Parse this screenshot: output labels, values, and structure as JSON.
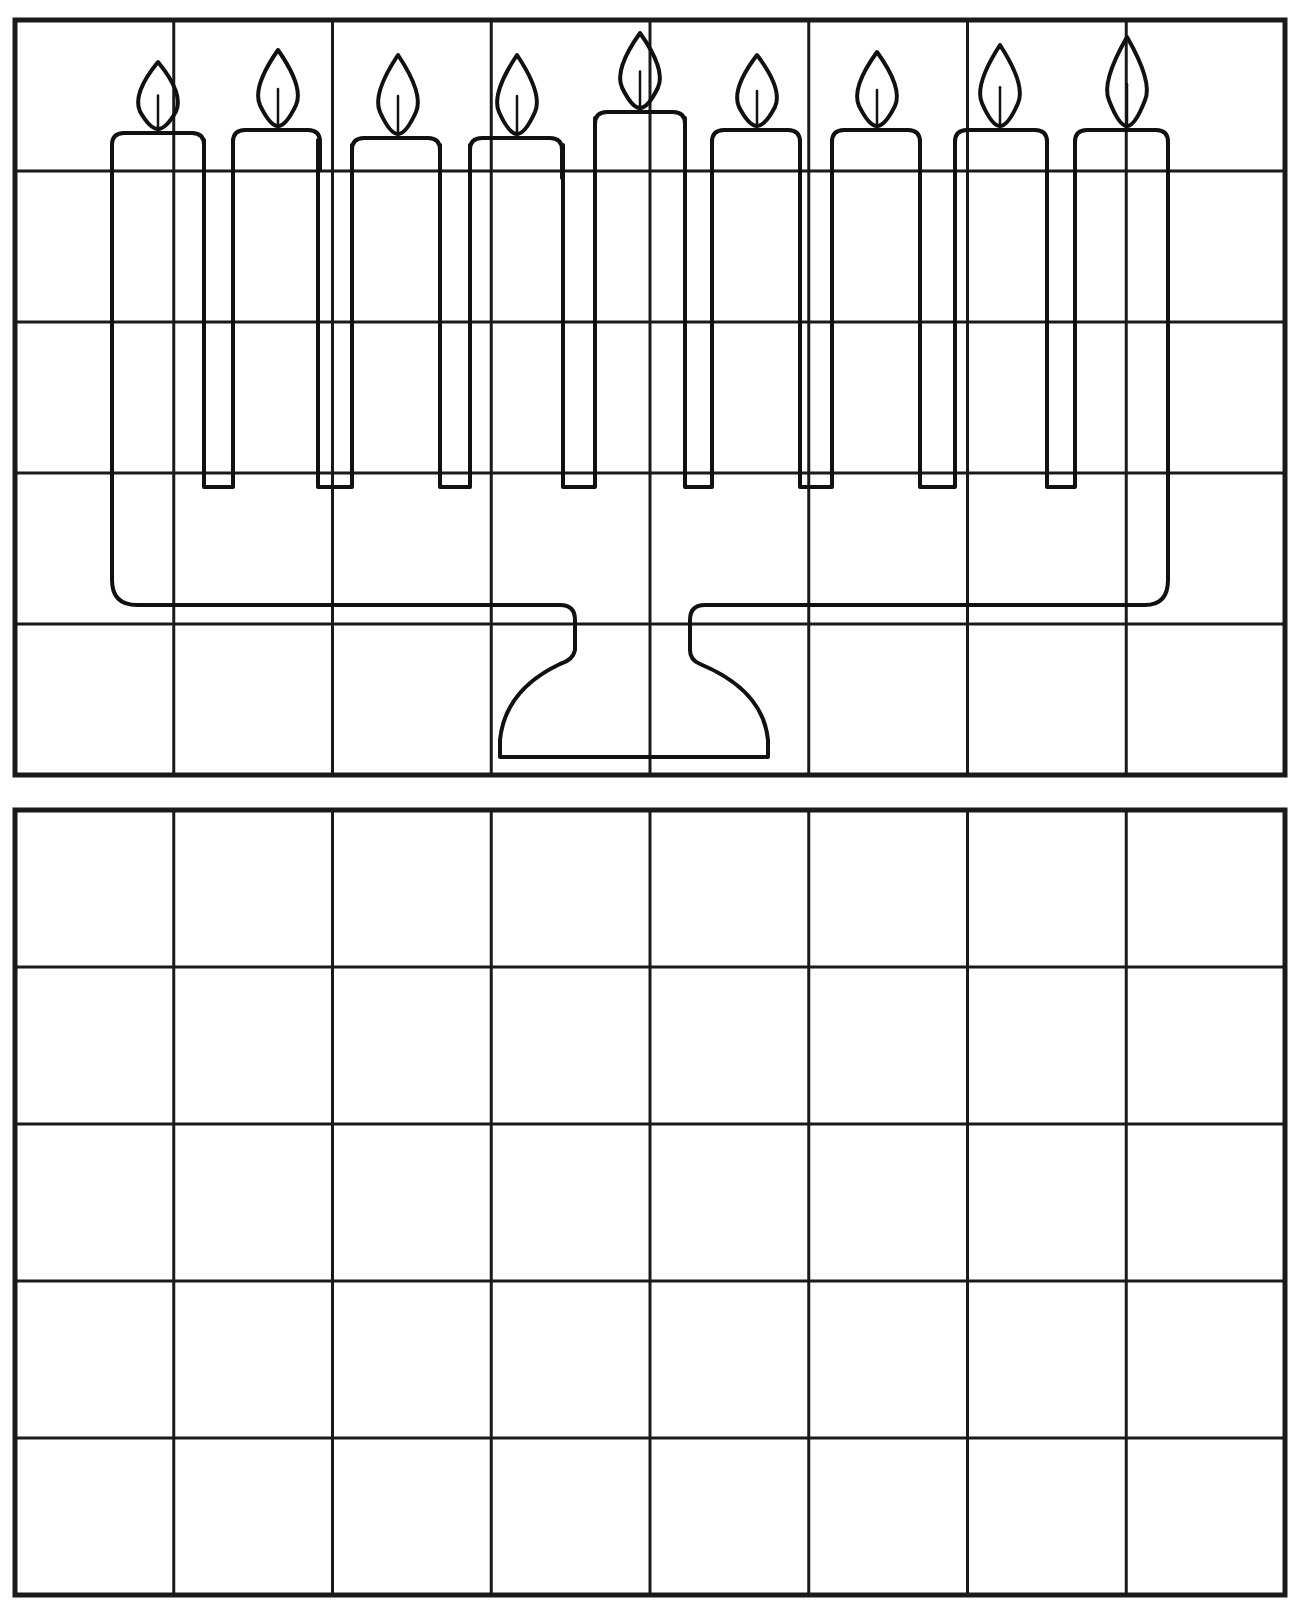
{
  "worksheet": {
    "type": "grid-drawing-copy-exercise",
    "subject": "menorah",
    "reference_grid": {
      "columns": 8,
      "rows": 5,
      "x": 15,
      "y": 20,
      "width": 1270,
      "height": 755
    },
    "practice_grid": {
      "columns": 8,
      "rows": 5,
      "x": 15,
      "y": 810,
      "width": 1270,
      "height": 785
    },
    "candles": [
      {
        "index": 1,
        "x": 112,
        "top": 133,
        "width": 92,
        "flame_cx": 158,
        "flame_top": 62
      },
      {
        "index": 2,
        "x": 233,
        "top": 130,
        "width": 87,
        "flame_cx": 278,
        "flame_top": 50
      },
      {
        "index": 3,
        "x": 352,
        "top": 138,
        "width": 88,
        "flame_cx": 398,
        "flame_top": 55
      },
      {
        "index": 4,
        "x": 470,
        "top": 138,
        "width": 92,
        "flame_cx": 517,
        "flame_top": 55
      },
      {
        "index": 5,
        "x": 595,
        "top": 112,
        "width": 90,
        "flame_cx": 640,
        "flame_top": 33,
        "center": true
      },
      {
        "index": 6,
        "x": 712,
        "top": 130,
        "width": 88,
        "flame_cx": 757,
        "flame_top": 55
      },
      {
        "index": 7,
        "x": 832,
        "top": 130,
        "width": 88,
        "flame_cx": 877,
        "flame_top": 52
      },
      {
        "index": 8,
        "x": 955,
        "top": 130,
        "width": 92,
        "flame_cx": 1000,
        "flame_top": 45
      },
      {
        "index": 9,
        "x": 1075,
        "top": 130,
        "width": 93,
        "flame_cx": 1127,
        "flame_top": 37
      }
    ],
    "colors": {
      "ink": "#111111",
      "paper": "#ffffff"
    }
  }
}
